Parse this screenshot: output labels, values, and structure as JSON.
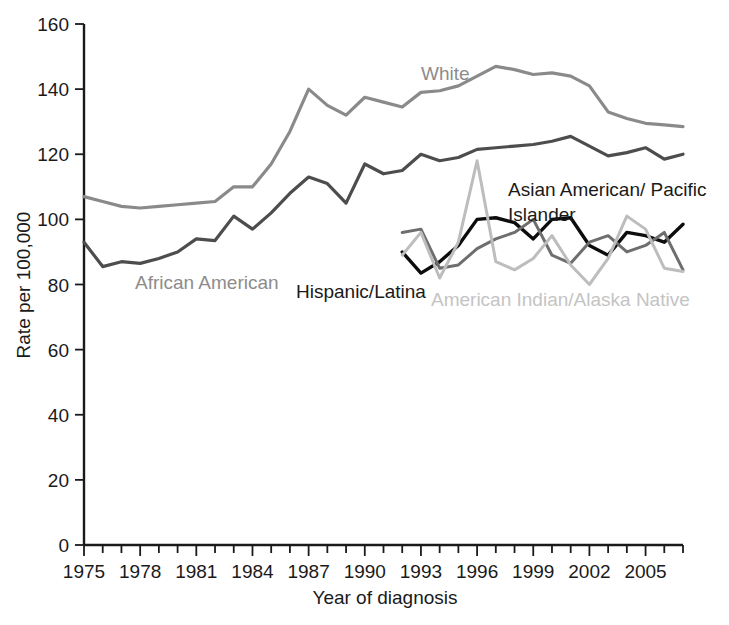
{
  "chart_data": {
    "type": "line",
    "title": "",
    "xlabel": "Year of diagnosis",
    "ylabel": "Rate per 100,000",
    "xlim": [
      1975,
      2007
    ],
    "ylim": [
      0,
      160
    ],
    "grid": false,
    "legend_position": "inline-annotations",
    "y_ticks": [
      0,
      20,
      40,
      60,
      80,
      100,
      120,
      140,
      160
    ],
    "y_tick_labels": [
      "0",
      "20",
      "40",
      "60",
      "80",
      "100",
      "120",
      "140",
      "160"
    ],
    "x_ticks": [
      1975,
      1976,
      1977,
      1978,
      1979,
      1980,
      1981,
      1982,
      1983,
      1984,
      1985,
      1986,
      1987,
      1988,
      1989,
      1990,
      1991,
      1992,
      1993,
      1994,
      1995,
      1996,
      1997,
      1998,
      1999,
      2000,
      2001,
      2002,
      2003,
      2004,
      2005,
      2006,
      2007
    ],
    "x_tick_labels": [
      "1975",
      "1978",
      "1981",
      "1984",
      "1987",
      "1990",
      "1993",
      "1996",
      "1999",
      "2002",
      "2005"
    ],
    "x_tick_labels_years": [
      1975,
      1978,
      1981,
      1984,
      1987,
      1990,
      1993,
      1996,
      1999,
      2002,
      2005
    ],
    "series": [
      {
        "name": "White",
        "color": "#8a8a8a",
        "width": 3.2,
        "label_x": 1988.2,
        "label_y": 148.5,
        "x": [
          1975,
          1976,
          1977,
          1978,
          1979,
          1980,
          1981,
          1982,
          1983,
          1984,
          1985,
          1986,
          1987,
          1988,
          1989,
          1990,
          1991,
          1992,
          1993,
          1994,
          1995,
          1996,
          1997,
          1998,
          1999,
          2000,
          2001,
          2002,
          2003,
          2004,
          2005,
          2006,
          2007
        ],
        "values": [
          107,
          105.5,
          104,
          103.5,
          104,
          104.5,
          105,
          105.5,
          110,
          110,
          117,
          127,
          140,
          135,
          132,
          137.5,
          136,
          134.5,
          139,
          139.5,
          141,
          144,
          147,
          146,
          144.5,
          145,
          144,
          141,
          133,
          131,
          129.5,
          129,
          128.5
        ]
      },
      {
        "name": "African American",
        "color": "#4d4d4d",
        "width": 3.2,
        "label_x": 1977.6,
        "label_y": 81.5,
        "x": [
          1975,
          1976,
          1977,
          1978,
          1979,
          1980,
          1981,
          1982,
          1983,
          1984,
          1985,
          1986,
          1987,
          1988,
          1989,
          1990,
          1991,
          1992,
          1993,
          1994,
          1995,
          1996,
          1997,
          1998,
          1999,
          2000,
          2001,
          2002,
          2003,
          2004,
          2005,
          2006,
          2007
        ],
        "values": [
          93,
          85.5,
          87,
          86.5,
          88,
          90,
          94,
          93.5,
          101,
          97,
          102,
          108,
          113,
          111,
          105,
          117,
          114,
          115,
          120,
          118,
          119,
          121.5,
          122,
          122.5,
          123,
          124,
          125.5,
          122.5,
          119.5,
          120.5,
          122,
          118.5,
          120
        ]
      },
      {
        "name": "Hispanic/Latina",
        "color": "#0d0d0d",
        "width": 3.4,
        "label_x": 1988.0,
        "label_y": 84.0,
        "x": [
          1992,
          1993,
          1994,
          1995,
          1996,
          1997,
          1998,
          1999,
          2000,
          2001,
          2002,
          2003,
          2004,
          2005,
          2006,
          2007
        ],
        "values": [
          90,
          83.5,
          87,
          92,
          100,
          100.5,
          99,
          94,
          100,
          100.5,
          92,
          89,
          96,
          95,
          93,
          98.5
        ]
      },
      {
        "name": "Asian American/ Pacific Islander",
        "color": "#6e6e6e",
        "width": 3.0,
        "label_x": 1995.8,
        "label_y": 111.0,
        "x": [
          1992,
          1993,
          1994,
          1995,
          1996,
          1997,
          1998,
          1999,
          2000,
          2001,
          2002,
          2003,
          2004,
          2005,
          2006,
          2007
        ],
        "values": [
          96,
          97,
          85,
          86,
          91,
          94,
          96,
          100,
          89,
          86.5,
          93,
          95,
          90,
          92,
          96,
          84.5
        ]
      },
      {
        "name": "American Indian/Alaska Native",
        "color": "#bdbdbd",
        "width": 3.0,
        "label_x": 1995.4,
        "label_y": 72.5,
        "x": [
          1992,
          1993,
          1994,
          1995,
          1996,
          1997,
          1998,
          1999,
          2000,
          2001,
          2002,
          2003,
          2004,
          2005,
          2006,
          2007
        ],
        "values": [
          89,
          96,
          82,
          93,
          118,
          87,
          84.5,
          88,
          95,
          86,
          80,
          88,
          101,
          97,
          85,
          84
        ]
      }
    ]
  },
  "labels": {
    "white": "White",
    "african_american": "African American",
    "hispanic_latina": "Hispanic/Latina",
    "asian_line1": "Asian American/ Pacific",
    "asian_line2": "Islander",
    "american_indian": "American Indian/Alaska Native",
    "ylabel": "Rate per 100,000",
    "xlabel": "Year of diagnosis"
  }
}
